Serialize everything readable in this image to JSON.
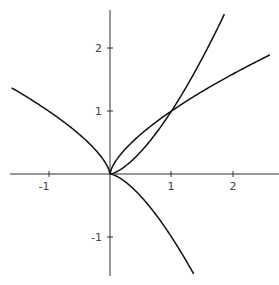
{
  "chart_data": {
    "type": "line",
    "title": "",
    "xlabel": "",
    "ylabel": "",
    "xlim": [
      -1.8,
      2.6
    ],
    "ylim": [
      -1.6,
      2.6
    ],
    "grid": false,
    "legend": null,
    "x_ticks": [
      -1,
      1,
      2
    ],
    "y_ticks": [
      -1,
      1,
      2
    ],
    "series": [
      {
        "name": "y = |x|^(2/3), x<0",
        "x": [
          -1.6,
          -1.0,
          -0.5,
          0
        ],
        "y": [
          1.368,
          1.0,
          0.63,
          0
        ]
      },
      {
        "name": "y = x^(2/3)",
        "x": [
          0,
          0.5,
          1.0,
          2.0,
          2.6
        ],
        "y": [
          0,
          0.63,
          1.0,
          1.587,
          1.891
        ]
      },
      {
        "name": "y = x^(3/2)",
        "x": [
          0,
          0.5,
          1.0,
          1.5,
          1.86
        ],
        "y": [
          0,
          0.354,
          1.0,
          1.837,
          2.537
        ]
      },
      {
        "name": "y = -x^(3/2)",
        "x": [
          0,
          0.5,
          1.0,
          1.36
        ],
        "y": [
          0,
          -0.354,
          -1.0,
          -1.586
        ]
      }
    ]
  },
  "axes": {
    "x_tick_labels": [
      "-1",
      "1",
      "2"
    ],
    "y_tick_labels": [
      "2",
      "1",
      "-1"
    ]
  },
  "colors": {
    "curve": "#111111",
    "axis": "#333333",
    "label": "#444444"
  }
}
